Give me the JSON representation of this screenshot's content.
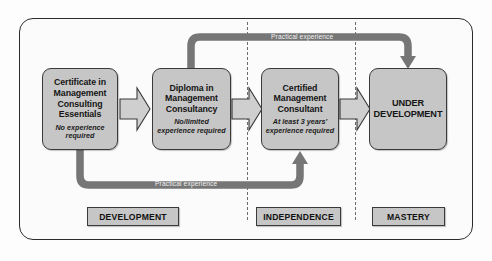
{
  "diagram": {
    "colors": {
      "box_fill": "#c6c6c6",
      "box_border": "#3a3a3a",
      "band": "#767676",
      "divider": "#6d6d6d",
      "frame_border": "#2b2b2b",
      "background": "#fbfbfb",
      "band_label_text": "#f2f2f2"
    },
    "qualifications": [
      {
        "title": "Certificate in Management Consulting Essentials",
        "requirement": "No experience required"
      },
      {
        "title": "Diploma in Management Consultancy",
        "requirement": "No/limited experience required"
      },
      {
        "title": "Certified Management Consultant",
        "requirement": "At least 3 years' experience required"
      },
      {
        "title": "UNDER DEVELOPMENT",
        "requirement": ""
      }
    ],
    "feedback_bands": [
      {
        "label": "Practical experience",
        "from": "Diploma in Management Consultancy",
        "to": "UNDER DEVELOPMENT",
        "position": "top"
      },
      {
        "label": "Practical experience",
        "from": "Certificate in Management Consulting Essentials",
        "to": "Certified Management Consultant",
        "position": "bottom"
      }
    ],
    "progression_arrows": [
      {
        "from": "Certificate in Management Consulting Essentials",
        "to": "Diploma in Management Consultancy"
      },
      {
        "from": "Diploma in Management Consultancy",
        "to": "Certified Management Consultant"
      },
      {
        "from": "Certified Management Consultant",
        "to": "UNDER DEVELOPMENT"
      }
    ],
    "stages": [
      {
        "label": "DEVELOPMENT"
      },
      {
        "label": "INDEPENDENCE"
      },
      {
        "label": "MASTERY"
      }
    ]
  }
}
